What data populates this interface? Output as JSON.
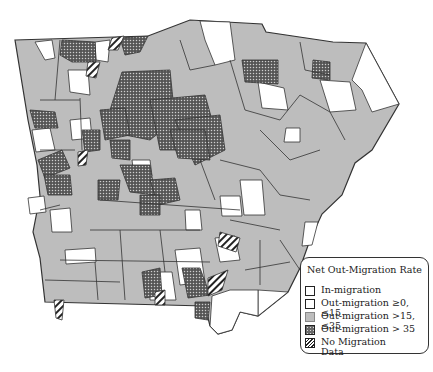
{
  "map": {
    "region": "Georgia counties",
    "colors": {
      "in_migration": "#ffffff",
      "out_0_15": "#ffffff",
      "out_15_35": "#bdbdbd",
      "out_35_plus": "#6a6a6a",
      "no_data": "hatched",
      "border": "#333333"
    }
  },
  "legend": {
    "title": "Net Out-Migration Rate",
    "items": [
      {
        "label": "In-migration",
        "swatch": "in-migration"
      },
      {
        "label": "Out-migration ≥0, ≤15",
        "swatch": "out-0-15"
      },
      {
        "label": "Out-migration >15, ≤35",
        "swatch": "out-15-35"
      },
      {
        "label": "Out-migration > 35",
        "swatch": "out-35-plus"
      },
      {
        "label": "No Migration",
        "label2": "Data",
        "swatch": "no-data"
      }
    ]
  }
}
